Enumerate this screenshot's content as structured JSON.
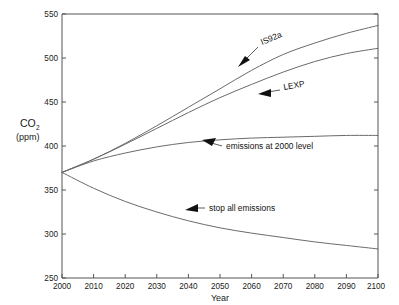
{
  "chart_data": {
    "type": "line",
    "title": "",
    "xlabel": "Year",
    "ylabel": "CO2 (ppm)",
    "ylabel_main": "CO",
    "ylabel_sub": "2",
    "ylabel_unit": "(ppm)",
    "xlim": [
      2000,
      2100
    ],
    "ylim": [
      250,
      550
    ],
    "grid": false,
    "legend": "none (inline annotations with arrows)",
    "xticks": [
      2000,
      2010,
      2020,
      2030,
      2040,
      2050,
      2060,
      2070,
      2080,
      2090,
      2100
    ],
    "yticks": [
      250,
      300,
      350,
      400,
      450,
      500,
      550
    ],
    "x": [
      2000,
      2010,
      2020,
      2030,
      2040,
      2050,
      2060,
      2070,
      2080,
      2090,
      2100
    ],
    "series": [
      {
        "name": "IS92a",
        "label": "IS92a",
        "values": [
          370,
          385,
          403,
          423,
          444,
          465,
          486,
          504,
          517,
          528,
          537
        ]
      },
      {
        "name": "LEXP",
        "label": "LEXP",
        "values": [
          370,
          385,
          402,
          420,
          438,
          455,
          470,
          484,
          496,
          505,
          511
        ]
      },
      {
        "name": "emissions at 2000 level",
        "label": "emissions at 2000 level",
        "values": [
          370,
          383,
          392,
          399,
          404,
          407,
          409,
          410,
          411,
          412,
          412
        ]
      },
      {
        "name": "stop all emissions",
        "label": "stop all emissions",
        "values": [
          370,
          352,
          337,
          325,
          315,
          307,
          301,
          296,
          291,
          287,
          283
        ]
      }
    ],
    "annotations": [
      {
        "id": "is92a",
        "text": "IS92a",
        "rotation_deg": -22,
        "points_to_year": 2057,
        "points_to_value": 470
      },
      {
        "id": "lexp",
        "text": "LEXP",
        "rotation_deg": -10,
        "points_to_year": 2061,
        "points_to_value": 452
      },
      {
        "id": "emissions-2000",
        "text": "emissions at 2000 level",
        "rotation_deg": 0,
        "points_to_year": 2041,
        "points_to_value": 404
      },
      {
        "id": "stop-all",
        "text": "stop all emissions",
        "rotation_deg": 0,
        "points_to_year": 2038,
        "points_to_value": 313
      }
    ],
    "colors": {
      "line": "#6b6b6b",
      "axis": "#555555",
      "text": "#1a1a1a",
      "background": "#ffffff"
    }
  },
  "axes": {
    "x_title": "Year",
    "y_title_main": "CO",
    "y_title_sub": "2",
    "y_title_unit": "(ppm)",
    "xtick_labels": [
      "2000",
      "2010",
      "2020",
      "2030",
      "2040",
      "2050",
      "2060",
      "2070",
      "2080",
      "2090",
      "2100"
    ],
    "ytick_labels": [
      "250",
      "300",
      "350",
      "400",
      "450",
      "500",
      "550"
    ]
  },
  "annotations": {
    "is92a": "IS92a",
    "lexp": "LEXP",
    "emissions_2000": "emissions at 2000 level",
    "stop_all": "stop all emissions"
  }
}
